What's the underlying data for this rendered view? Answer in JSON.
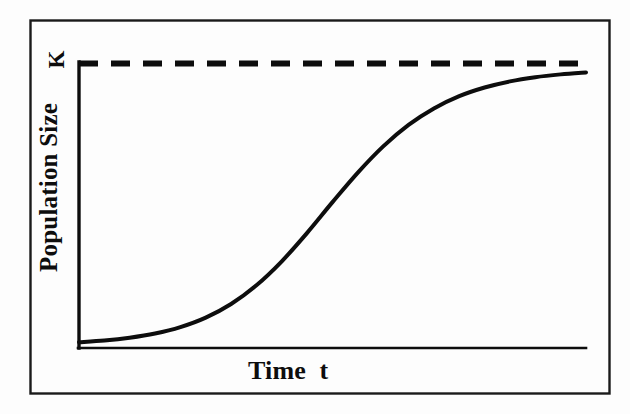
{
  "figure": {
    "kind": "logistic-growth-curve",
    "background_color": "#fdfdfd",
    "ink_color": "#0d0d0d",
    "frame": {
      "x": 30,
      "y": 20,
      "width": 580,
      "height": 374
    }
  },
  "labels": {
    "y_axis": "Population Size",
    "x_axis": "Time  t",
    "carrying_capacity": "K"
  },
  "chart_data": {
    "type": "line",
    "title": "",
    "xlabel": "Time  t",
    "ylabel": "Population Size",
    "xlim": [
      0,
      1
    ],
    "ylim": [
      0,
      1
    ],
    "grid": false,
    "legend": "none",
    "annotations": [
      {
        "text": "K",
        "meaning": "carrying capacity asymptote",
        "x": 0.0,
        "y": 1.0,
        "style": "dashed-horizontal-line"
      }
    ],
    "series": [
      {
        "name": "Population Size N(t)",
        "style": "solid",
        "line_width": 4,
        "color": "#0d0d0d",
        "x": [
          0.0,
          0.05,
          0.1,
          0.15,
          0.2,
          0.25,
          0.3,
          0.35,
          0.4,
          0.45,
          0.5,
          0.55,
          0.6,
          0.65,
          0.7,
          0.75,
          0.8,
          0.85,
          0.9,
          0.95,
          1.0
        ],
        "y": [
          0.01,
          0.016,
          0.026,
          0.041,
          0.064,
          0.098,
          0.147,
          0.214,
          0.3,
          0.402,
          0.512,
          0.618,
          0.712,
          0.789,
          0.848,
          0.892,
          0.923,
          0.945,
          0.96,
          0.97,
          0.977
        ]
      },
      {
        "name": "Carrying capacity K",
        "style": "dashed",
        "line_width": 5,
        "color": "#0d0d0d",
        "x": [
          0.0,
          1.0
        ],
        "y": [
          1.0,
          1.0
        ]
      }
    ]
  }
}
